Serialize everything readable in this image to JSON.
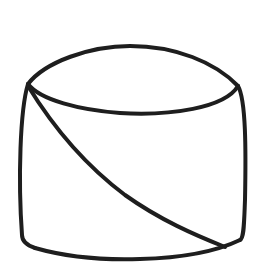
{
  "figure": {
    "stroke_color": "#1e1e1e",
    "background": "#ffffff"
  }
}
